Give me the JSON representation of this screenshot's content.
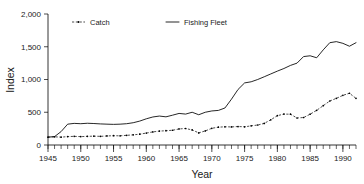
{
  "chart_data": {
    "type": "line",
    "title": "",
    "xlabel": "Year",
    "ylabel": "Index",
    "xlim": [
      1945,
      1992
    ],
    "ylim": [
      0,
      2000
    ],
    "grid": false,
    "legend_position": "top-left",
    "x_ticks": [
      1945,
      1950,
      1955,
      1960,
      1965,
      1970,
      1975,
      1980,
      1985,
      1990
    ],
    "x_tick_labels": [
      "1945",
      "1950",
      "1955",
      "1960",
      "1965",
      "1970",
      "1975",
      "1980",
      "1985",
      "1990"
    ],
    "x_minor_tick_step": 1,
    "y_ticks": [
      0,
      500,
      1000,
      1500,
      2000
    ],
    "y_tick_labels": [
      "0",
      "500",
      "1,000",
      "1,500",
      "2,000"
    ],
    "x": [
      1945,
      1946,
      1947,
      1948,
      1949,
      1950,
      1951,
      1952,
      1953,
      1954,
      1955,
      1956,
      1957,
      1958,
      1959,
      1960,
      1961,
      1962,
      1963,
      1964,
      1965,
      1966,
      1967,
      1968,
      1969,
      1970,
      1971,
      1972,
      1973,
      1974,
      1975,
      1976,
      1977,
      1978,
      1979,
      1980,
      1981,
      1982,
      1983,
      1984,
      1985,
      1986,
      1987,
      1988,
      1989,
      1990,
      1991,
      1992
    ],
    "series": [
      {
        "name": "Catch",
        "style": "dashed-with-markers",
        "color": "#000000",
        "values": [
          120,
          125,
          120,
          128,
          132,
          128,
          132,
          135,
          132,
          138,
          142,
          140,
          148,
          155,
          165,
          182,
          200,
          212,
          218,
          225,
          245,
          252,
          230,
          185,
          215,
          255,
          272,
          278,
          276,
          282,
          278,
          292,
          305,
          330,
          385,
          448,
          472,
          470,
          412,
          420,
          470,
          530,
          600,
          672,
          712,
          758,
          790,
          712
        ]
      },
      {
        "name": "Fishing Fleet",
        "style": "solid",
        "color": "#000000",
        "values": [
          120,
          128,
          205,
          318,
          330,
          325,
          332,
          328,
          322,
          318,
          315,
          318,
          325,
          340,
          365,
          400,
          428,
          442,
          430,
          455,
          482,
          472,
          500,
          462,
          500,
          520,
          528,
          565,
          700,
          848,
          948,
          965,
          1000,
          1042,
          1085,
          1128,
          1168,
          1215,
          1250,
          1350,
          1362,
          1332,
          1452,
          1562,
          1578,
          1552,
          1508,
          1562
        ]
      }
    ]
  },
  "legend": {
    "entries": [
      {
        "label": "Catch"
      },
      {
        "label": "Fishing Fleet"
      }
    ]
  },
  "axes": {
    "y_title": "Index",
    "x_title": "Year"
  }
}
